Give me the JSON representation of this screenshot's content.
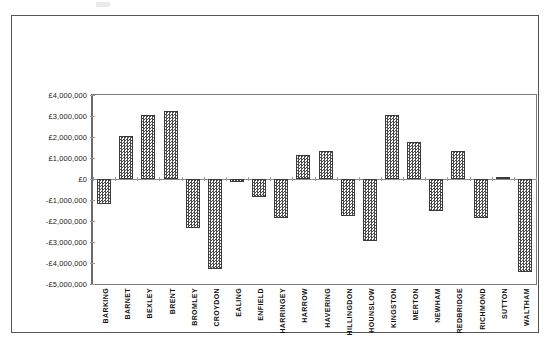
{
  "chart_data": {
    "type": "bar",
    "title": "",
    "xlabel": "",
    "ylabel": "",
    "ylim": [
      -5000000,
      4000000
    ],
    "ytick_step": 1000000,
    "ytick_labels": [
      "£4,000,000",
      "£3,000,000",
      "£2,000,000",
      "£1,000,000",
      "£0",
      "-£1,000,000",
      "-£2,000,000",
      "-£3,000,000",
      "-£4,000,000",
      "-£5,000,000"
    ],
    "ytick_values": [
      4000000,
      3000000,
      2000000,
      1000000,
      0,
      -1000000,
      -2000000,
      -3000000,
      -4000000,
      -5000000
    ],
    "grid": false,
    "legend": false,
    "categories": [
      "BARKING",
      "BARNET",
      "BEXLEY",
      "BRENT",
      "BROMLEY",
      "CROYDON",
      "EALING",
      "ENFIELD",
      "HARRINGEY",
      "HARROW",
      "HAVERING",
      "HILLINGDON",
      "HOUNSLOW",
      "KINGSTON",
      "MERTON",
      "NEWHAM",
      "REDBRIDGE",
      "RICHMOND",
      "SUTTON",
      "WALTHAM"
    ],
    "values": [
      -1200000,
      2050000,
      3050000,
      3250000,
      -2350000,
      -4300000,
      -150000,
      -850000,
      -1850000,
      1150000,
      1350000,
      -1750000,
      -2950000,
      3050000,
      1750000,
      -1500000,
      1350000,
      -1850000,
      100000,
      -4450000
    ],
    "series": [
      {
        "name": "",
        "values": [
          -1200000,
          2050000,
          3050000,
          3250000,
          -2350000,
          -4300000,
          -150000,
          -850000,
          -1850000,
          1150000,
          1350000,
          -1750000,
          -2950000,
          3050000,
          1750000,
          -1500000,
          1350000,
          -1850000,
          100000,
          -4450000
        ]
      }
    ],
    "colors": {
      "bar_fill": "#4a4a4a",
      "bar_border": "#3a3a3a",
      "axis": "#7a7a7a",
      "frame": "#555555",
      "background": "#ffffff",
      "text": "#111111"
    }
  }
}
